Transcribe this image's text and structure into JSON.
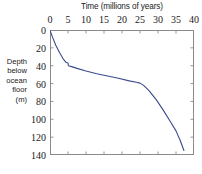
{
  "chart_data": {
    "type": "line",
    "title": "",
    "xlabel": "Time (millions of years)",
    "ylabel": "Depth below ocean floor (m)",
    "ylabel_lines": [
      "Depth",
      "below",
      "ocean",
      "floor",
      "(m)"
    ],
    "xlim": [
      0,
      40
    ],
    "ylim": [
      0,
      140
    ],
    "y_inverted": true,
    "x_axis_position": "top",
    "grid": false,
    "legend": null,
    "xticks": [
      0,
      5,
      10,
      15,
      20,
      25,
      30,
      35,
      40
    ],
    "xtick_labels": [
      "0",
      "5",
      "10",
      "15",
      "20",
      "25",
      "30",
      "35",
      "40"
    ],
    "yticks": [
      0,
      20,
      40,
      60,
      80,
      100,
      120,
      140
    ],
    "ytick_labels": [
      "0",
      "20",
      "40",
      "60",
      "80",
      "100",
      "120",
      "140"
    ],
    "line_color": "#3b4a8c",
    "line_width": 1.1,
    "series": [
      {
        "name": "sediment accumulation",
        "x": [
          0.0,
          0.7,
          1.6,
          2.6,
          3.6,
          4.5,
          5.0,
          5.1,
          6.0,
          7.5,
          10.0,
          13.0,
          16.0,
          19.0,
          22.0,
          24.0,
          25.0,
          26.0,
          27.5,
          29.5,
          31.5,
          33.5,
          35.0,
          36.2,
          37.2
        ],
        "y": [
          0.5,
          8.0,
          17.0,
          25.0,
          32.0,
          36.5,
          37.0,
          40.0,
          41.0,
          43.0,
          46.0,
          49.0,
          51.5,
          54.0,
          57.0,
          58.5,
          59.5,
          62.0,
          68.0,
          78.0,
          90.0,
          103.0,
          113.0,
          124.0,
          135.0
        ]
      }
    ]
  },
  "axes": {
    "frame_color": "#8a8a8a",
    "tick_color": "#8a8a8a"
  }
}
